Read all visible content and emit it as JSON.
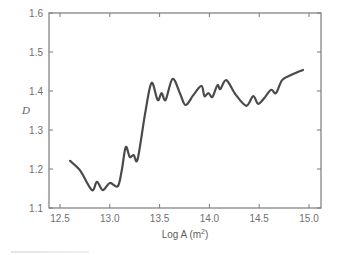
{
  "chart_data": {
    "type": "line",
    "title": "",
    "xlabel": "Log A (m",
    "xlabel_sup": "2",
    "xlabel_close": ")",
    "ylabel": "D",
    "xlim": [
      12.39,
      15.12
    ],
    "ylim": [
      1.1,
      1.6
    ],
    "xticks": [
      12.5,
      13.0,
      13.5,
      14.0,
      14.5,
      15.0
    ],
    "xtick_labels": [
      "12.5",
      "13.0",
      "13.5",
      "14.0",
      "14.5",
      "15.0"
    ],
    "yticks": [
      1.1,
      1.2,
      1.3,
      1.4,
      1.5,
      1.6
    ],
    "ytick_labels": [
      "1.1",
      "1.2",
      "1.3",
      "1.4",
      "1.5",
      "1.6"
    ],
    "grid": false,
    "legend": null,
    "line_color": "#4a4a4a",
    "series": [
      {
        "name": "D",
        "x": [
          12.6,
          12.7,
          12.82,
          12.87,
          12.93,
          13.0,
          13.08,
          13.12,
          13.16,
          13.2,
          13.24,
          13.28,
          13.36,
          13.42,
          13.48,
          13.52,
          13.56,
          13.63,
          13.7,
          13.76,
          13.84,
          13.92,
          13.95,
          13.99,
          14.03,
          14.08,
          14.11,
          14.17,
          14.26,
          14.37,
          14.44,
          14.49,
          14.56,
          14.62,
          14.67,
          14.73,
          14.82,
          14.94
        ],
        "y": [
          1.221,
          1.197,
          1.146,
          1.167,
          1.146,
          1.164,
          1.156,
          1.197,
          1.256,
          1.231,
          1.236,
          1.226,
          1.351,
          1.421,
          1.377,
          1.395,
          1.377,
          1.431,
          1.397,
          1.364,
          1.39,
          1.413,
          1.387,
          1.395,
          1.385,
          1.415,
          1.405,
          1.428,
          1.392,
          1.362,
          1.387,
          1.367,
          1.385,
          1.403,
          1.395,
          1.428,
          1.441,
          1.454
        ]
      }
    ]
  }
}
